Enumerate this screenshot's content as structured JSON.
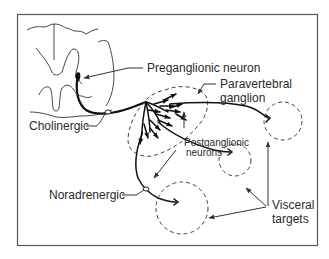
{
  "figure": {
    "labels": {
      "preganglionic": "Preganglionic neuron",
      "paravertebral_line1": "Paravertebral",
      "paravertebral_line2": "ganglion",
      "cholinergic": "Cholinergic",
      "postganglionic_line1": "Postganglionic",
      "postganglionic_line2": "neurons",
      "noradrenergic": "Noradrenergic",
      "visceral_line1": "Visceral",
      "visceral_line2": "targets"
    },
    "colors": {
      "stroke": "#111111",
      "text": "#2a2a2a",
      "border": "#555555",
      "background": "#ffffff"
    },
    "components": [
      "spinal-cord-cross-section",
      "preganglionic-neuron",
      "paravertebral-ganglion",
      "postganglionic-neurons",
      "visceral-targets"
    ],
    "visceral_target_count": 3
  }
}
